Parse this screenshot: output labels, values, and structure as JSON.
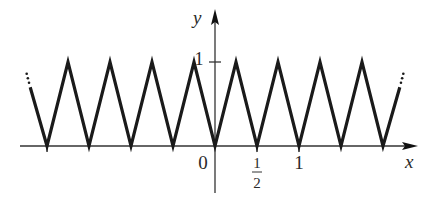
{
  "chart_data": {
    "type": "line",
    "title": "",
    "xlabel": "x",
    "ylabel": "y",
    "x_range": [
      -4.1,
      2.25
    ],
    "y_range": [
      -0.55,
      1.7
    ],
    "series": [
      {
        "name": "zigzag",
        "points": [
          [
            -2.2,
            0.7
          ],
          [
            -2.0,
            0
          ],
          [
            -1.75,
            1
          ],
          [
            -1.5,
            0
          ],
          [
            -1.25,
            1
          ],
          [
            -1.0,
            0
          ],
          [
            -0.75,
            1
          ],
          [
            -0.5,
            0
          ],
          [
            -0.25,
            1
          ],
          [
            0,
            0
          ],
          [
            0.25,
            1
          ],
          [
            0.5,
            0
          ],
          [
            0.75,
            1
          ],
          [
            1.0,
            0
          ],
          [
            1.25,
            1
          ],
          [
            1.5,
            0
          ],
          [
            1.75,
            1
          ],
          [
            2.0,
            0
          ],
          [
            2.2,
            0.7
          ]
        ],
        "continues_left": true,
        "continues_right": true
      }
    ],
    "x_ticks": [
      {
        "value": 0,
        "label": "0"
      },
      {
        "value": 0.5,
        "label_num": "1",
        "label_den": "2"
      },
      {
        "value": 1,
        "label": "1"
      }
    ],
    "y_ticks": [
      {
        "value": 1,
        "label": "1"
      }
    ],
    "grid": false,
    "legend": "none"
  }
}
